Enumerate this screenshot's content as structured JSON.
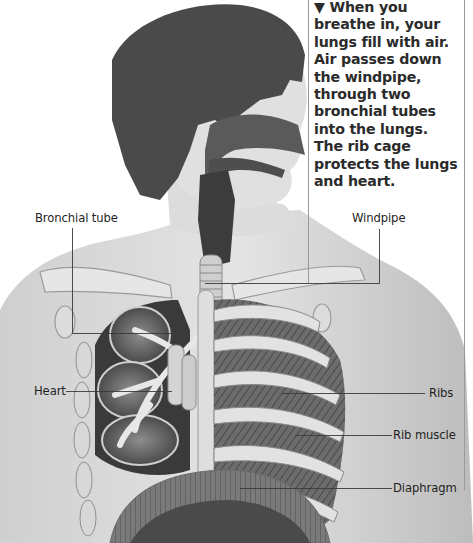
{
  "caption": {
    "marker": "▼",
    "lines": [
      "When you",
      "breathe in, your",
      "lungs fill with air.",
      "Air passes down",
      "the windpipe,",
      "through two",
      "bronchial tubes",
      "into the lungs.",
      "The rib cage",
      "protects the lungs",
      "and heart."
    ]
  },
  "labels": {
    "bronchial_tube": "Bronchial tube",
    "windpipe": "Windpipe",
    "heart": "Heart",
    "ribs": "Ribs",
    "rib_muscle": "Rib muscle",
    "diaphragm": "Diaphragm"
  },
  "colors": {
    "background": "#ffffff",
    "skin": "#d9d9d9",
    "hair": "#4a4a4a",
    "leader_line": "#3a3a3a",
    "caption_text": "#2b2b2b"
  }
}
